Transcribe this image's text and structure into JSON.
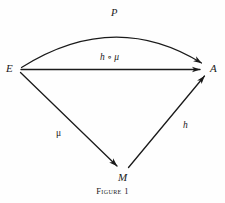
{
  "figure": {
    "caption": "Figure 1",
    "background_color": "#fefefe",
    "ink_color": "#1a1a1a"
  },
  "nodes": [
    {
      "id": "E",
      "label": "E",
      "x": 19,
      "y": 69
    },
    {
      "id": "A",
      "label": "A",
      "x": 208,
      "y": 69
    },
    {
      "id": "M",
      "label": "M",
      "x": 124,
      "y": 175
    }
  ],
  "edges": [
    {
      "id": "arc-E-A",
      "label": "P",
      "from": "E",
      "to": "A",
      "shape": "curved-arc"
    },
    {
      "id": "line-E-A",
      "label": "h ∘ μ",
      "from": "E",
      "to": "A",
      "shape": "straight"
    },
    {
      "id": "line-E-M",
      "label": "μ",
      "from": "E",
      "to": "M",
      "shape": "straight"
    },
    {
      "id": "line-M-A",
      "label": "h",
      "from": "M",
      "to": "A",
      "shape": "straight"
    }
  ],
  "labels": {
    "node_E": "E",
    "node_A": "A",
    "node_M": "M",
    "edge_P": "P",
    "edge_h_compose_mu": "h ∘ μ",
    "edge_mu": "μ",
    "edge_h": "h"
  }
}
